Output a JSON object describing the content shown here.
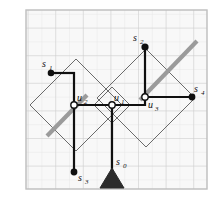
{
  "figure": {
    "kind": "geometric-diagram",
    "canvas": {
      "width": 219,
      "height": 199
    },
    "plot_area": {
      "x": 26,
      "y": 10,
      "width": 181,
      "height": 179
    },
    "background_color": "#ffffff",
    "plot_background_color": "#f7f7f7",
    "border_color": "#b8b8b8",
    "grid": {
      "visible": true,
      "minor_spacing": 13.8,
      "minor_color": "#e6e6e6",
      "major_spacing": 27.6,
      "major_color": "#cfcfcf"
    },
    "colors": {
      "thin_diamond_line": "#555555",
      "thick_tree_line": "#111111",
      "highlight_gray": "#9a9a9a",
      "filled_node": "#111111",
      "hollow_node_fill": "#ffffff",
      "hollow_node_stroke": "#111111",
      "source_triangle": "#2b2b2b"
    },
    "diamonds": [
      {
        "name": "diamond-left",
        "cx": 76,
        "cy": 105,
        "r": 46
      },
      {
        "name": "diamond-middle",
        "cx": 112,
        "cy": 105,
        "r": 18
      },
      {
        "name": "diamond-right",
        "cx": 146,
        "cy": 98,
        "r": 49
      }
    ],
    "highlight_segments": [
      {
        "name": "highlight-left",
        "x1": 47,
        "y1": 136,
        "x2": 87,
        "y2": 95
      },
      {
        "name": "highlight-right",
        "x1": 140,
        "y1": 100,
        "x2": 197,
        "y2": 41
      }
    ],
    "tree_edges": [
      {
        "name": "edge-s1-corner",
        "x1": 51,
        "y1": 73,
        "x2": 74,
        "y2": 73
      },
      {
        "name": "edge-corner-u2",
        "x1": 74,
        "y1": 73,
        "x2": 74,
        "y2": 105
      },
      {
        "name": "edge-u2-u1",
        "x1": 74,
        "y1": 105,
        "x2": 112,
        "y2": 105
      },
      {
        "name": "edge-u2-s3",
        "x1": 74,
        "y1": 105,
        "x2": 74,
        "y2": 172
      },
      {
        "name": "edge-u1-s0",
        "x1": 112,
        "y1": 105,
        "x2": 112,
        "y2": 170
      },
      {
        "name": "edge-u1-corner",
        "x1": 112,
        "y1": 105,
        "x2": 145,
        "y2": 105
      },
      {
        "name": "edge-corner-u3",
        "x1": 145,
        "y1": 105,
        "x2": 145,
        "y2": 97
      },
      {
        "name": "edge-u3-s2",
        "x1": 145,
        "y1": 97,
        "x2": 145,
        "y2": 47
      },
      {
        "name": "edge-u3-s4",
        "x1": 145,
        "y1": 97,
        "x2": 192,
        "y2": 97
      }
    ],
    "nodes": [
      {
        "name": "node-s1",
        "label": "s",
        "sub": "1",
        "x": 51,
        "y": 73,
        "type": "filled",
        "label_dx": -9,
        "label_dy": -6
      },
      {
        "name": "node-s2",
        "label": "s",
        "sub": "2",
        "x": 145,
        "y": 47,
        "type": "filled",
        "label_dx": -12,
        "label_dy": -6
      },
      {
        "name": "node-s3",
        "label": "s",
        "sub": "3",
        "x": 74,
        "y": 172,
        "type": "filled",
        "label_dx": 4,
        "label_dy": 9
      },
      {
        "name": "node-s4",
        "label": "s",
        "sub": "4",
        "x": 192,
        "y": 97,
        "type": "filled",
        "label_dx": 2,
        "label_dy": -5
      },
      {
        "name": "node-u1",
        "label": "u",
        "sub": "1",
        "x": 112,
        "y": 105,
        "type": "hollow",
        "label_dx": 2,
        "label_dy": -5
      },
      {
        "name": "node-u2",
        "label": "u",
        "sub": "2",
        "x": 74,
        "y": 105,
        "type": "hollow",
        "label_dx": 3,
        "label_dy": -5
      },
      {
        "name": "node-u3",
        "label": "u",
        "sub": "3",
        "x": 145,
        "y": 97,
        "type": "hollow",
        "label_dx": 3,
        "label_dy": 10
      }
    ],
    "source": {
      "name": "node-s0",
      "label": "s",
      "sub": "0",
      "x": 112,
      "y": 188,
      "apex_y": 168,
      "half_width": 12,
      "label_dx": 5,
      "label_dy": -18
    }
  }
}
